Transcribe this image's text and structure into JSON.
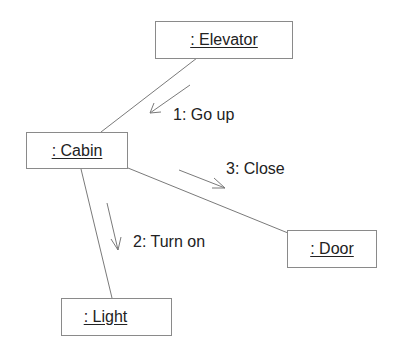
{
  "diagram": {
    "type": "UML communication diagram",
    "objects": [
      {
        "id": "elevator",
        "label": ": Elevator"
      },
      {
        "id": "cabin",
        "label": ": Cabin"
      },
      {
        "id": "door",
        "label": ": Door"
      },
      {
        "id": "light",
        "label": ": Light"
      }
    ],
    "links": [
      {
        "from": "elevator",
        "to": "cabin"
      },
      {
        "from": "cabin",
        "to": "door"
      },
      {
        "from": "cabin",
        "to": "light"
      }
    ],
    "messages": [
      {
        "seq": 1,
        "label": "1: Go up",
        "from": "elevator",
        "to": "cabin"
      },
      {
        "seq": 2,
        "label": "2: Turn on",
        "from": "cabin",
        "to": "light"
      },
      {
        "seq": 3,
        "label": "3: Close",
        "from": "cabin",
        "to": "door"
      }
    ],
    "colors": {
      "line": "#7a7a7a",
      "box_border": "#8a8a8a",
      "text": "#222222"
    }
  }
}
